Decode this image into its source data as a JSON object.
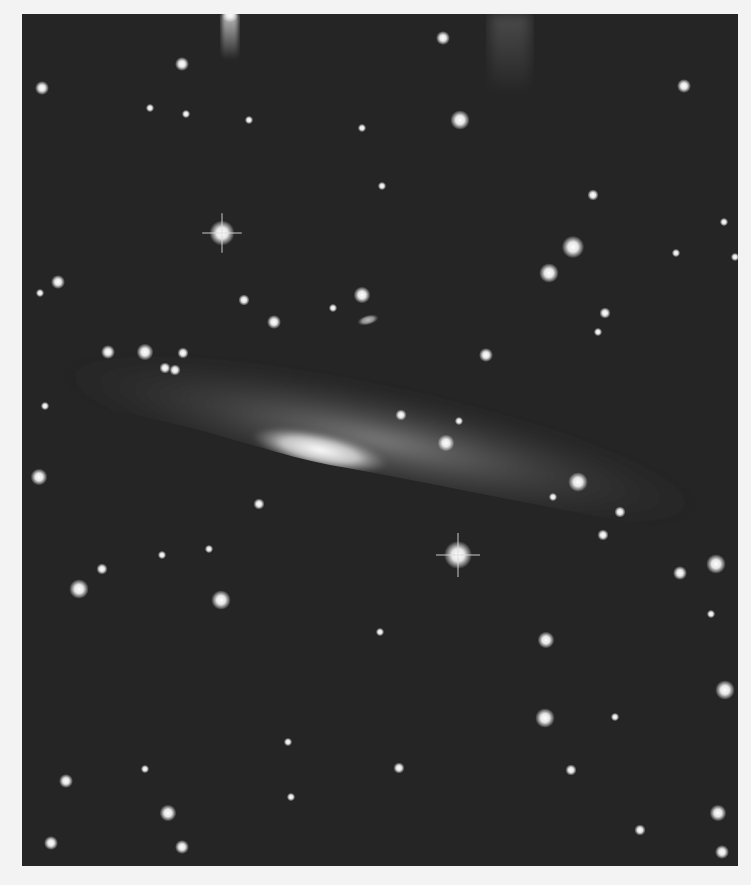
{
  "image": {
    "subject": "Edge-on galaxy with dark dust lane in a star field",
    "colors": {
      "border": "#f3f3f3",
      "sky": "#252525",
      "galaxy_core": "#e8e8e8",
      "halo": "#8a8a8a",
      "star": "#f0f0f0"
    },
    "frame": {
      "x": 22,
      "y": 14,
      "width": 716,
      "height": 852
    },
    "galaxy": {
      "core": {
        "cx": 320,
        "cy": 450,
        "rx": 70,
        "ry": 18,
        "rotate": 12
      },
      "halo": {
        "cx": 380,
        "cy": 440,
        "rx": 330,
        "ry": 55,
        "rotate": 12
      },
      "dust_lane_edge_y_at_x0": 400
    },
    "small_galaxy": {
      "cx": 368,
      "cy": 320,
      "rx": 11,
      "ry": 5,
      "rotate": -15
    },
    "stars": [
      {
        "x": 222,
        "y": 233,
        "r": 9,
        "spikes": true
      },
      {
        "x": 458,
        "y": 555,
        "r": 10,
        "spikes": true
      },
      {
        "x": 230,
        "y": 14,
        "r": 6,
        "glare": true
      },
      {
        "x": 42,
        "y": 88,
        "r": 5
      },
      {
        "x": 182,
        "y": 64,
        "r": 5
      },
      {
        "x": 443,
        "y": 38,
        "r": 5
      },
      {
        "x": 460,
        "y": 120,
        "r": 7
      },
      {
        "x": 684,
        "y": 86,
        "r": 5
      },
      {
        "x": 362,
        "y": 128,
        "r": 3
      },
      {
        "x": 150,
        "y": 108,
        "r": 3
      },
      {
        "x": 186,
        "y": 114,
        "r": 3
      },
      {
        "x": 249,
        "y": 120,
        "r": 3
      },
      {
        "x": 382,
        "y": 186,
        "r": 3
      },
      {
        "x": 593,
        "y": 195,
        "r": 4
      },
      {
        "x": 573,
        "y": 247,
        "r": 8
      },
      {
        "x": 549,
        "y": 273,
        "r": 7
      },
      {
        "x": 605,
        "y": 313,
        "r": 4
      },
      {
        "x": 676,
        "y": 253,
        "r": 3
      },
      {
        "x": 724,
        "y": 222,
        "r": 3
      },
      {
        "x": 735,
        "y": 257,
        "r": 3
      },
      {
        "x": 362,
        "y": 295,
        "r": 6
      },
      {
        "x": 244,
        "y": 300,
        "r": 4
      },
      {
        "x": 274,
        "y": 322,
        "r": 5
      },
      {
        "x": 333,
        "y": 308,
        "r": 3
      },
      {
        "x": 58,
        "y": 282,
        "r": 5
      },
      {
        "x": 40,
        "y": 293,
        "r": 3
      },
      {
        "x": 108,
        "y": 352,
        "r": 5
      },
      {
        "x": 145,
        "y": 352,
        "r": 6
      },
      {
        "x": 183,
        "y": 353,
        "r": 4
      },
      {
        "x": 165,
        "y": 368,
        "r": 4
      },
      {
        "x": 175,
        "y": 370,
        "r": 4
      },
      {
        "x": 45,
        "y": 406,
        "r": 3
      },
      {
        "x": 39,
        "y": 477,
        "r": 6
      },
      {
        "x": 486,
        "y": 355,
        "r": 5
      },
      {
        "x": 598,
        "y": 332,
        "r": 3
      },
      {
        "x": 401,
        "y": 415,
        "r": 4
      },
      {
        "x": 446,
        "y": 443,
        "r": 6
      },
      {
        "x": 459,
        "y": 421,
        "r": 3
      },
      {
        "x": 578,
        "y": 482,
        "r": 7
      },
      {
        "x": 553,
        "y": 497,
        "r": 3
      },
      {
        "x": 620,
        "y": 512,
        "r": 4
      },
      {
        "x": 603,
        "y": 535,
        "r": 4
      },
      {
        "x": 259,
        "y": 504,
        "r": 4
      },
      {
        "x": 162,
        "y": 555,
        "r": 3
      },
      {
        "x": 209,
        "y": 549,
        "r": 3
      },
      {
        "x": 102,
        "y": 569,
        "r": 4
      },
      {
        "x": 79,
        "y": 589,
        "r": 7
      },
      {
        "x": 221,
        "y": 600,
        "r": 7
      },
      {
        "x": 716,
        "y": 564,
        "r": 7
      },
      {
        "x": 680,
        "y": 573,
        "r": 5
      },
      {
        "x": 711,
        "y": 614,
        "r": 3
      },
      {
        "x": 546,
        "y": 640,
        "r": 6
      },
      {
        "x": 380,
        "y": 632,
        "r": 3
      },
      {
        "x": 725,
        "y": 690,
        "r": 7
      },
      {
        "x": 545,
        "y": 718,
        "r": 7
      },
      {
        "x": 615,
        "y": 717,
        "r": 3
      },
      {
        "x": 399,
        "y": 768,
        "r": 4
      },
      {
        "x": 571,
        "y": 770,
        "r": 4
      },
      {
        "x": 288,
        "y": 742,
        "r": 3
      },
      {
        "x": 145,
        "y": 769,
        "r": 3
      },
      {
        "x": 66,
        "y": 781,
        "r": 5
      },
      {
        "x": 291,
        "y": 797,
        "r": 3
      },
      {
        "x": 168,
        "y": 813,
        "r": 6
      },
      {
        "x": 718,
        "y": 813,
        "r": 6
      },
      {
        "x": 51,
        "y": 843,
        "r": 5
      },
      {
        "x": 182,
        "y": 847,
        "r": 5
      },
      {
        "x": 640,
        "y": 830,
        "r": 4
      },
      {
        "x": 722,
        "y": 852,
        "r": 5
      }
    ]
  }
}
